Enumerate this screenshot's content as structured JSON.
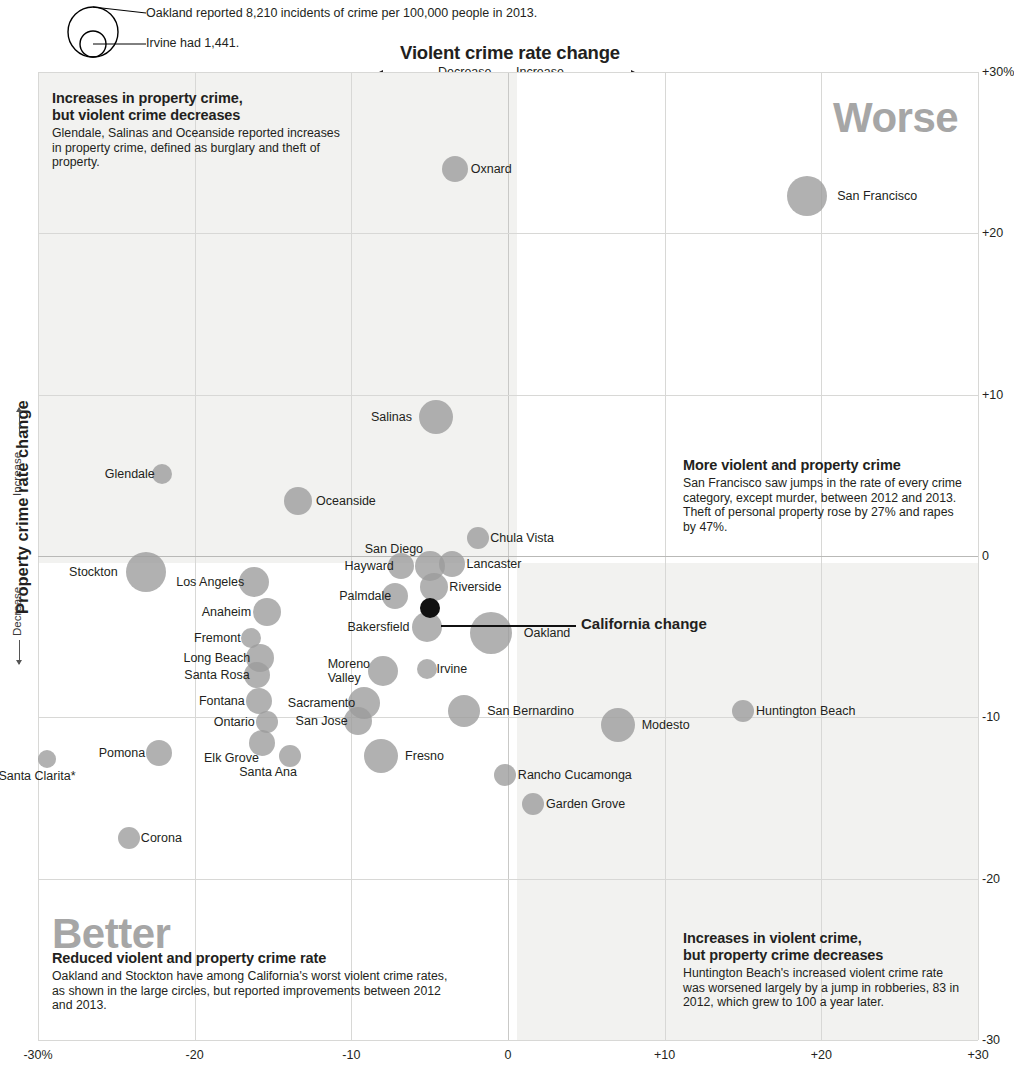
{
  "legend": {
    "big_label": "Oakland reported 8,210 incidents of crime per 100,000 people in 2013.",
    "small_label": "Irvine had 1,441."
  },
  "axes": {
    "x_title": "Violent crime rate change",
    "x_decrease": "Decrease",
    "x_increase": "Increase",
    "y_title": "Property crime rate change",
    "y_decrease": "Decrease",
    "y_increase": "Increase",
    "x_ticks": [
      "-30%",
      "-20",
      "-10",
      "0",
      "+10",
      "+20",
      "+30"
    ],
    "y_ticks": [
      "+30%",
      "+20",
      "+10",
      "0",
      "-10",
      "-20",
      "-30"
    ]
  },
  "quadrant_words": {
    "worse": "Worse",
    "better": "Better"
  },
  "annotations": {
    "top_left": {
      "heading_line1": "Increases in property crime,",
      "heading_line2": "but violent crime decreases",
      "body": "Glendale, Salinas and Oceanside reported increases in property crime, defined as burglary and theft of property."
    },
    "middle_right": {
      "heading_line1": "More violent and property crime",
      "heading_line2": "",
      "body": "San Francisco saw jumps in the rate of every crime category, except murder, between 2012 and 2013. Theft of personal property rose by 27% and rapes by 47%."
    },
    "bottom_left": {
      "heading_line1": "Reduced violent and property crime rate",
      "heading_line2": "",
      "body": "Oakland and Stockton have among California's worst violent crime rates, as shown in the large circles, but reported improvements between 2012 and 2013."
    },
    "bottom_right": {
      "heading_line1": "Increases in violent crime,",
      "heading_line2": "but property crime decreases",
      "body": "Huntington Beach's increased violent crime rate was worsened largely by a jump in robberies, 83 in 2012, which grew to 100 a year later."
    }
  },
  "callout": {
    "label": "California change"
  },
  "chart_data": {
    "type": "scatter",
    "title": "Violent crime rate change",
    "xlabel": "Violent crime rate change",
    "ylabel": "Property crime rate change",
    "xlim": [
      -30,
      30
    ],
    "ylim": [
      -30,
      30
    ],
    "grid": true,
    "size_encodes": "total crime incidents per 100,000 people in 2013",
    "points": [
      {
        "name": "Oxnard",
        "x": -3.4,
        "y": 24.0,
        "r": 13,
        "label_dx": 18,
        "label_dy": -7
      },
      {
        "name": "San Francisco",
        "x": 19.1,
        "y": 22.3,
        "r": 20,
        "label_dx": 25,
        "label_dy": -7
      },
      {
        "name": "Salinas",
        "x": -4.6,
        "y": 8.6,
        "r": 17,
        "label_dx": -63,
        "label_dy": -7
      },
      {
        "name": "Glendale",
        "x": -22.1,
        "y": 5.1,
        "r": 10,
        "label_dx": -62,
        "label_dy": -7
      },
      {
        "name": "Oceanside",
        "x": -13.4,
        "y": 3.4,
        "r": 14,
        "label_dx": 19,
        "label_dy": -7
      },
      {
        "name": "Chula Vista",
        "x": -1.9,
        "y": 1.1,
        "r": 11,
        "label_dx": 16,
        "label_dy": -7
      },
      {
        "name": "San Diego",
        "x": -5.0,
        "y": -0.6,
        "r": 15,
        "label_dx": -65,
        "label_dy": -24
      },
      {
        "name": "Hayward",
        "x": -6.8,
        "y": -0.6,
        "r": 13,
        "label_dx": -59,
        "label_dy": -7
      },
      {
        "name": "Lancaster",
        "x": -3.6,
        "y": -0.5,
        "r": 13,
        "label_dx": 17,
        "label_dy": -7
      },
      {
        "name": "Los Angeles",
        "x": -16.2,
        "y": -1.6,
        "r": 15,
        "label_dx": -78,
        "label_dy": -7
      },
      {
        "name": "Riverside",
        "x": -4.7,
        "y": -1.9,
        "r": 14,
        "label_dx": 16,
        "label_dy": -7
      },
      {
        "name": "Palmdale",
        "x": -7.2,
        "y": -2.5,
        "r": 13,
        "label_dx": -58,
        "label_dy": -7
      },
      {
        "name": "Anaheim",
        "x": -15.4,
        "y": -3.5,
        "r": 14,
        "label_dx": -66,
        "label_dy": -7
      },
      {
        "name": "Bakersfield",
        "x": -5.2,
        "y": -4.4,
        "r": 15,
        "label_dx": -79,
        "label_dy": -7
      },
      {
        "name": "Oakland",
        "x": -1.1,
        "y": -4.8,
        "r": 21,
        "label_dx": 27,
        "label_dy": -7
      },
      {
        "name": "Fremont",
        "x": -16.4,
        "y": -5.1,
        "r": 10,
        "label_dx": -62,
        "label_dy": -7
      },
      {
        "name": "Long Beach",
        "x": -15.8,
        "y": -6.3,
        "r": 14,
        "label_dx": -78,
        "label_dy": -7
      },
      {
        "name": "Moreno Valley",
        "x": -8.0,
        "y": -7.1,
        "r": 15,
        "label_dx": -55,
        "label_dy": -14
      },
      {
        "name": "Irvine",
        "x": -5.2,
        "y": -7.0,
        "r": 10,
        "label_dx": 15,
        "label_dy": -7
      },
      {
        "name": "Santa Rosa",
        "x": -16.0,
        "y": -7.4,
        "r": 13,
        "label_dx": -75,
        "label_dy": -7
      },
      {
        "name": "Fontana",
        "x": -15.9,
        "y": -9.0,
        "r": 13,
        "label_dx": -62,
        "label_dy": -7
      },
      {
        "name": "Sacramento",
        "x": -9.2,
        "y": -9.1,
        "r": 16,
        "label_dx": -75,
        "label_dy": -7
      },
      {
        "name": "San Bernardino",
        "x": -2.8,
        "y": -9.6,
        "r": 16,
        "label_dx": 22,
        "label_dy": -7
      },
      {
        "name": "Huntington Beach",
        "x": 15.0,
        "y": -9.6,
        "r": 11,
        "label_dx": 17,
        "label_dy": -7
      },
      {
        "name": "San Jose",
        "x": -9.6,
        "y": -10.2,
        "r": 14,
        "label_dx": -63,
        "label_dy": -7
      },
      {
        "name": "Ontario",
        "x": -15.4,
        "y": -10.3,
        "r": 11,
        "label_dx": -57,
        "label_dy": -7
      },
      {
        "name": "Modesto",
        "x": 7.0,
        "y": -10.5,
        "r": 17,
        "label_dx": 22,
        "label_dy": -7
      },
      {
        "name": "Elk Grove",
        "x": -15.7,
        "y": -11.6,
        "r": 13,
        "label_dx": -60,
        "label_dy": 8
      },
      {
        "name": "Fresno",
        "x": -8.1,
        "y": -12.4,
        "r": 17,
        "label_dx": 22,
        "label_dy": -7
      },
      {
        "name": "Pomona",
        "x": -22.3,
        "y": -12.2,
        "r": 13,
        "label_dx": -62,
        "label_dy": -7
      },
      {
        "name": "Santa Ana",
        "x": -13.9,
        "y": -12.4,
        "r": 11,
        "label_dx": -55,
        "label_dy": 9
      },
      {
        "name": "Santa Clarita*",
        "x": -29.4,
        "y": -12.6,
        "r": 9,
        "label_dx": -55,
        "label_dy": 10
      },
      {
        "name": "Rancho Cucamonga",
        "x": -0.2,
        "y": -13.6,
        "r": 11,
        "label_dx": 17,
        "label_dy": -7
      },
      {
        "name": "Garden Grove",
        "x": 1.6,
        "y": -15.4,
        "r": 11,
        "label_dx": 17,
        "label_dy": -7
      },
      {
        "name": "Corona",
        "x": -24.2,
        "y": -17.5,
        "r": 11,
        "label_dx": 16,
        "label_dy": -7
      },
      {
        "name": "Stockton",
        "x": -23.1,
        "y": -1.0,
        "r": 20,
        "label_dx": -72,
        "label_dy": -7
      },
      {
        "name": "California change",
        "x": -5.0,
        "y": -3.2,
        "r": 10,
        "dark": true,
        "label_dx": 0,
        "label_dy": 0,
        "no_label": true
      }
    ]
  }
}
